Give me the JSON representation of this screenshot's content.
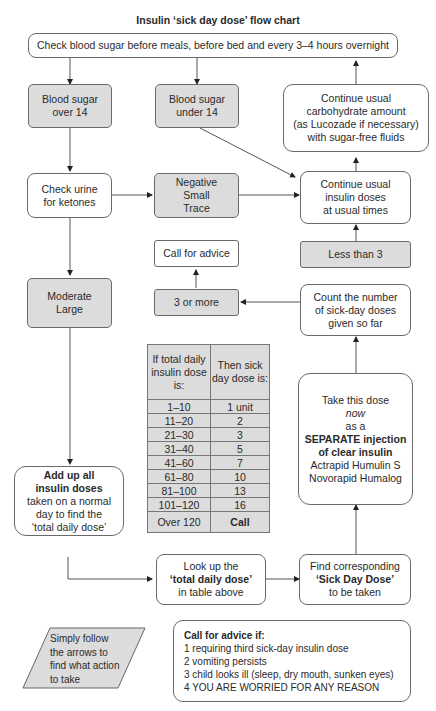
{
  "title": "Insulin ‘sick day dose’ flow chart",
  "nodes": {
    "check_blood": "Check blood sugar before meals, before bed and every 3–4 hours overnight",
    "over14": [
      "Blood sugar",
      "over 14"
    ],
    "under14": [
      "Blood sugar",
      "under 14"
    ],
    "carb": [
      "Continue usual",
      "carbohydrate amount",
      "(as Lucozade if necessary)",
      "with sugar-free fluids"
    ],
    "urine": [
      "Check urine",
      "for ketones"
    ],
    "neg": [
      "Negative",
      "Small",
      "Trace"
    ],
    "continue_insulin": [
      "Continue usual",
      "insulin doses",
      "at usual times"
    ],
    "call_advice": "Call for advice",
    "less3": "Less than 3",
    "three_more": "3 or more",
    "count": [
      "Count the number",
      "of sick-day doses",
      "given so far"
    ],
    "moderate": [
      "Moderate",
      "Large"
    ],
    "take_dose": {
      "l1": "Take this dose",
      "l2": "now",
      "l3": "as a",
      "l4": "SEPARATE injection",
      "l5": "of clear insulin",
      "l6": "Actrapid Humulin S",
      "l7": "Novorapid Humalog"
    },
    "add_up": {
      "bold1": "Add up all",
      "bold2": "insulin doses",
      "l3": "taken on a normal",
      "l4": "day to find the",
      "l5": "‘total daily dose’"
    },
    "lookup": {
      "l1": "Look up the",
      "l2": "‘total daily dose’",
      "l3": "in table above"
    },
    "find": {
      "l1": "Find corresponding",
      "l2": "‘Sick Day Dose’",
      "l3": "to be taken"
    }
  },
  "table": {
    "header": [
      "If total daily insulin dose is:",
      "Then sick day dose is:"
    ],
    "rows": [
      [
        "1–10",
        "1 unit"
      ],
      [
        "11–20",
        "2"
      ],
      [
        "21–30",
        "3"
      ],
      [
        "31–40",
        "5"
      ],
      [
        "41–60",
        "7"
      ],
      [
        "61–80",
        "10"
      ],
      [
        "81–100",
        "13"
      ],
      [
        "101–120",
        "16"
      ],
      [
        "Over 120",
        "Call"
      ]
    ]
  },
  "legend": "Simply follow the arrows to find what action to take",
  "advice": {
    "heading": "Call for advice if:",
    "items": [
      "1  requiring third sick-day insulin dose",
      "2  vomiting persists",
      "3  child looks ill (sleep, dry mouth, sunken eyes)",
      "4  YOU ARE WORRIED FOR ANY REASON"
    ]
  }
}
